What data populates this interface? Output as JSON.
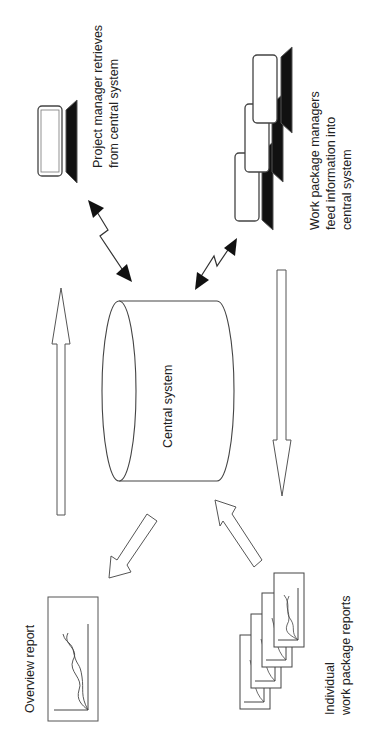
{
  "diagram": {
    "nodes": {
      "central": {
        "label": "Central system",
        "shape": "cylinder"
      },
      "project_manager": {
        "label_line1": "Project manager retrieves",
        "label_line2": "from central system",
        "icon": "computer-icon"
      },
      "work_package_managers": {
        "label_line1": "Work package managers",
        "label_line2": "feed information into",
        "label_line3": "central system",
        "icon": "computer-stack-icon"
      },
      "overview_report": {
        "label": "Overview report",
        "icon": "chart-report-icon"
      },
      "individual_reports": {
        "label_line1": "Individual",
        "label_line2": "work package reports",
        "icon": "report-stack-icon",
        "count": 4
      }
    },
    "edges": [
      {
        "from": "central",
        "to": "project_manager",
        "type": "bidirectional-lightning"
      },
      {
        "from": "work_package_managers",
        "to": "central",
        "type": "bidirectional-lightning"
      },
      {
        "from": "individual_reports",
        "to": "central",
        "type": "block-arrow"
      },
      {
        "from": "central",
        "to": "overview_report",
        "type": "block-arrow"
      },
      {
        "direction": "up",
        "type": "long-arrow",
        "side": "left"
      },
      {
        "direction": "down",
        "type": "long-arrow",
        "side": "right"
      }
    ],
    "colors": {
      "stroke": "#333333",
      "fill": "#ffffff",
      "dark": "#111111"
    }
  }
}
